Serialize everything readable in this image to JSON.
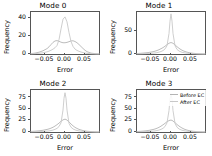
{
  "figure": {
    "width": 212,
    "height": 156,
    "background": "#ffffff",
    "layout": "2x2 grid of frequency distribution plots"
  },
  "legend": {
    "position": "upper-right of Mode 3 panel",
    "entries": [
      {
        "label": "Before EC",
        "color": "#b4b4b4"
      },
      {
        "label": "After EC",
        "color": "#c8c8c8"
      }
    ]
  },
  "chart_data": [
    {
      "type": "line",
      "title": "Mode 0",
      "xlabel": "Error",
      "ylabel": "Frequency",
      "xlim": [
        -0.085,
        0.085
      ],
      "ylim": [
        0,
        47
      ],
      "xticks": [
        -0.05,
        0.0,
        0.05
      ],
      "xticklabels": [
        "−0.05",
        "0.00",
        "0.05"
      ],
      "yticks": [
        0,
        20,
        40
      ],
      "yticklabels": [
        "0",
        "20",
        "40"
      ],
      "grid": false,
      "x": [
        -0.085,
        -0.075,
        -0.065,
        -0.055,
        -0.045,
        -0.04,
        -0.035,
        -0.03,
        -0.025,
        -0.02,
        -0.015,
        -0.01,
        -0.005,
        0.0,
        0.005,
        0.01,
        0.015,
        0.02,
        0.025,
        0.03,
        0.035,
        0.04,
        0.045,
        0.05,
        0.055,
        0.065,
        0.075,
        0.085
      ],
      "series": [
        {
          "name": "Before EC",
          "color": "#b4b4b4",
          "values": [
            0.4,
            1.0,
            2.0,
            3.6,
            6.0,
            8.0,
            10.5,
            13.0,
            14.6,
            15.0,
            14.2,
            13.2,
            12.6,
            12.6,
            13.0,
            13.8,
            14.6,
            14.8,
            14.0,
            12.6,
            10.6,
            8.4,
            6.2,
            4.2,
            2.6,
            1.0,
            0.4,
            0.2
          ]
        },
        {
          "name": "After EC",
          "color": "#c8c8c8",
          "values": [
            0.2,
            0.4,
            0.8,
            1.4,
            2.4,
            3.2,
            4.2,
            5.4,
            7.0,
            9.5,
            16.0,
            28.0,
            39.0,
            41.5,
            36.0,
            24.0,
            14.0,
            8.5,
            5.5,
            4.0,
            3.0,
            2.2,
            1.6,
            1.1,
            0.7,
            0.3,
            0.1,
            0.0
          ]
        }
      ]
    },
    {
      "type": "line",
      "title": "Mode 1",
      "xlabel": "Error",
      "ylabel": "Frequency",
      "xlim": [
        -0.085,
        0.085
      ],
      "ylim": [
        0,
        92
      ],
      "xticks": [
        -0.05,
        0.0,
        0.05
      ],
      "xticklabels": [
        "−0.05",
        "0.00",
        "0.05"
      ],
      "yticks": [
        0,
        50
      ],
      "yticklabels": [
        "0",
        "50"
      ],
      "grid": false,
      "x": [
        -0.085,
        -0.075,
        -0.065,
        -0.055,
        -0.045,
        -0.04,
        -0.035,
        -0.03,
        -0.025,
        -0.02,
        -0.015,
        -0.01,
        -0.005,
        -0.0025,
        0.0,
        0.0025,
        0.005,
        0.01,
        0.015,
        0.02,
        0.025,
        0.03,
        0.035,
        0.04,
        0.045,
        0.05,
        0.055,
        0.065,
        0.075,
        0.085
      ],
      "series": [
        {
          "name": "Before EC",
          "color": "#b4b4b4",
          "values": [
            1.0,
            1.6,
            2.4,
            3.4,
            5.0,
            6.2,
            7.6,
            9.4,
            11.6,
            14.0,
            17.0,
            20.5,
            23.5,
            24.5,
            25.0,
            24.5,
            23.5,
            20.0,
            16.0,
            12.5,
            9.5,
            7.2,
            5.4,
            4.0,
            3.0,
            2.2,
            1.6,
            0.8,
            0.4,
            0.2
          ]
        },
        {
          "name": "After EC",
          "color": "#c8c8c8",
          "values": [
            0.3,
            0.5,
            0.8,
            1.2,
            1.8,
            2.3,
            3.0,
            4.0,
            5.4,
            7.5,
            11.0,
            18.0,
            45.0,
            72.0,
            88.0,
            72.0,
            45.0,
            18.0,
            10.0,
            6.5,
            4.5,
            3.2,
            2.4,
            1.8,
            1.3,
            1.0,
            0.7,
            0.3,
            0.15,
            0.05
          ]
        }
      ]
    },
    {
      "type": "line",
      "title": "Mode 2",
      "xlabel": "Error",
      "ylabel": "Frequency",
      "xlim": [
        -0.085,
        0.085
      ],
      "ylim": [
        0,
        92
      ],
      "xticks": [
        -0.05,
        0.0,
        0.05
      ],
      "xticklabels": [
        "−0.05",
        "0.00",
        "0.05"
      ],
      "yticks": [
        0,
        25,
        50,
        75
      ],
      "yticklabels": [
        "0",
        "25",
        "50",
        "75"
      ],
      "grid": false,
      "x": [
        -0.085,
        -0.075,
        -0.065,
        -0.055,
        -0.045,
        -0.04,
        -0.035,
        -0.03,
        -0.025,
        -0.02,
        -0.015,
        -0.01,
        -0.005,
        -0.0025,
        0.0,
        0.0025,
        0.005,
        0.01,
        0.015,
        0.02,
        0.025,
        0.03,
        0.035,
        0.04,
        0.045,
        0.05,
        0.055,
        0.065,
        0.075,
        0.085
      ],
      "series": [
        {
          "name": "Before EC",
          "color": "#b4b4b4",
          "values": [
            1.2,
            1.8,
            2.6,
            3.8,
            5.6,
            6.8,
            8.4,
            10.4,
            13.0,
            16.0,
            19.5,
            23.5,
            26.5,
            27.5,
            28.0,
            27.5,
            26.0,
            22.0,
            17.5,
            13.5,
            10.2,
            7.8,
            5.8,
            4.4,
            3.2,
            2.4,
            1.7,
            0.9,
            0.4,
            0.2
          ]
        },
        {
          "name": "After EC",
          "color": "#c8c8c8",
          "values": [
            0.3,
            0.5,
            0.8,
            1.2,
            1.9,
            2.4,
            3.2,
            4.2,
            5.8,
            8.0,
            12.0,
            20.0,
            48.0,
            74.0,
            86.0,
            74.0,
            48.0,
            19.0,
            10.5,
            6.8,
            4.6,
            3.3,
            2.4,
            1.8,
            1.3,
            1.0,
            0.7,
            0.3,
            0.15,
            0.05
          ]
        }
      ]
    },
    {
      "type": "line",
      "title": "Mode 3",
      "xlabel": "Error",
      "ylabel": "Frequency",
      "xlim": [
        -0.085,
        0.085
      ],
      "ylim": [
        0,
        92
      ],
      "xticks": [
        -0.05,
        0.0,
        0.05
      ],
      "xticklabels": [
        "−0.05",
        "0.00",
        "0.05"
      ],
      "yticks": [
        0,
        25,
        50,
        75
      ],
      "yticklabels": [
        "0",
        "25",
        "50",
        "75"
      ],
      "grid": false,
      "x": [
        -0.085,
        -0.075,
        -0.065,
        -0.055,
        -0.045,
        -0.04,
        -0.035,
        -0.03,
        -0.025,
        -0.02,
        -0.015,
        -0.01,
        -0.005,
        -0.0025,
        0.0,
        0.0025,
        0.005,
        0.01,
        0.015,
        0.02,
        0.025,
        0.03,
        0.035,
        0.04,
        0.045,
        0.05,
        0.055,
        0.065,
        0.075,
        0.085
      ],
      "series": [
        {
          "name": "Before EC",
          "color": "#b4b4b4",
          "values": [
            1.0,
            1.6,
            2.4,
            3.6,
            5.4,
            6.6,
            8.2,
            10.2,
            12.8,
            15.8,
            19.0,
            22.5,
            25.0,
            25.8,
            26.0,
            25.5,
            24.0,
            20.5,
            16.5,
            13.0,
            10.0,
            7.6,
            5.6,
            4.2,
            3.1,
            2.3,
            1.6,
            0.8,
            0.4,
            0.2
          ]
        },
        {
          "name": "After EC",
          "color": "#c8c8c8",
          "values": [
            0.3,
            0.5,
            0.8,
            1.2,
            1.9,
            2.4,
            3.2,
            4.2,
            5.8,
            8.0,
            12.0,
            20.0,
            47.0,
            72.0,
            84.0,
            72.0,
            47.0,
            19.0,
            10.5,
            6.8,
            4.6,
            3.3,
            2.4,
            1.8,
            1.3,
            1.0,
            0.7,
            0.3,
            0.15,
            0.05
          ]
        }
      ]
    }
  ]
}
